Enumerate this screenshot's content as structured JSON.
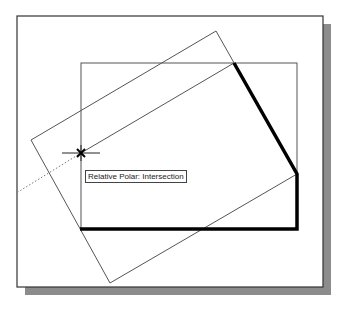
{
  "tooltip": {
    "text": "Relative Polar: Intersection"
  },
  "colors": {
    "background": "#ffffff",
    "frame": "#333333",
    "shadow": "#8c8c8c",
    "thin_line": "#555555",
    "heavy_line": "#000000",
    "tracking_line": "#777777",
    "cursor": "#222222"
  },
  "drawing": {
    "frame": {
      "x": 17,
      "y": 16,
      "width": 306,
      "height": 271
    },
    "shadow_offset": 8,
    "inner_rectangle": {
      "x": 81,
      "y": 63,
      "width": 216,
      "height": 166
    },
    "tilted_rectangle": [
      [
        216,
        31
      ],
      [
        297,
        174
      ],
      [
        110,
        283
      ],
      [
        31,
        140
      ]
    ],
    "heavy_polyline": [
      [
        234,
        63
      ],
      [
        297,
        174
      ],
      [
        297,
        229
      ],
      [
        80,
        229
      ]
    ],
    "construction_line": [
      [
        234,
        63
      ],
      [
        81,
        153
      ]
    ],
    "tracking_line": [
      [
        81,
        153
      ],
      [
        18,
        192
      ]
    ],
    "cursor": {
      "x": 81,
      "y": 153,
      "crosshair_half_length": 19,
      "marker_size": 4
    }
  }
}
